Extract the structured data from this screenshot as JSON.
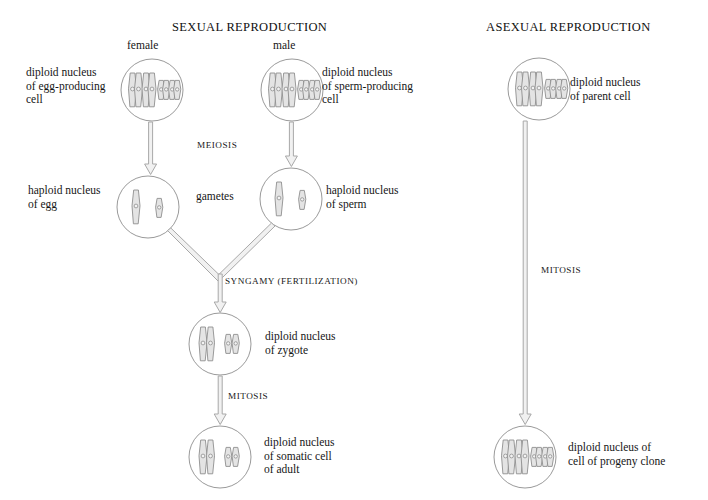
{
  "figure": {
    "columns": [
      {
        "id": "sexual",
        "title": "SEXUAL REPRODUCTION"
      },
      {
        "id": "asexual",
        "title": "ASEXUAL REPRODUCTION"
      }
    ]
  },
  "sexual": {
    "title": "SEXUAL REPRODUCTION",
    "female_label": "female",
    "male_label": "male",
    "egg_parent_label": "diploid nucleus\nof egg-producing\ncell",
    "sperm_parent_label": "diploid nucleus\nof sperm-producing\ncell",
    "meiosis_label": "MEIOSIS",
    "gametes_label": "gametes",
    "egg_label": "haploid nucleus\nof egg",
    "sperm_label": "haploid nucleus\nof sperm",
    "syngamy_label": "SYNGAMY (FERTILIZATION)",
    "zygote_label": "diploid nucleus\nof zygote",
    "mitosis_label": "MITOSIS",
    "somatic_label": "diploid nucleus\nof somatic cell\nof adult"
  },
  "asexual": {
    "title": "ASEXUAL REPRODUCTION",
    "parent_label": "diploid nucleus\nof parent cell",
    "mitosis_label": "MITOSIS",
    "progeny_label": "diploid nucleus of\ncell of progeny clone"
  },
  "cells": [
    {
      "id": "egg-parent-cell",
      "name": "diploid nucleus of egg-producing cell",
      "ploidy": "diploid",
      "cx": 152,
      "cy": 90,
      "r": 31,
      "chromosomes": "two-pairs-duplicated"
    },
    {
      "id": "sperm-parent-cell",
      "name": "diploid nucleus of sperm-producing cell",
      "ploidy": "diploid",
      "cx": 292,
      "cy": 90,
      "r": 31,
      "chromosomes": "two-pairs-duplicated"
    },
    {
      "id": "egg-cell",
      "name": "haploid nucleus of egg",
      "ploidy": "haploid",
      "cx": 148,
      "cy": 207,
      "r": 31,
      "chromosomes": "two-single"
    },
    {
      "id": "sperm-cell",
      "name": "haploid nucleus of sperm",
      "ploidy": "haploid",
      "cx": 291,
      "cy": 199,
      "r": 31,
      "chromosomes": "two-single"
    },
    {
      "id": "zygote-cell",
      "name": "diploid nucleus of zygote",
      "ploidy": "diploid",
      "cx": 220,
      "cy": 344,
      "r": 31,
      "chromosomes": "two-pairs-single"
    },
    {
      "id": "somatic-cell",
      "name": "diploid nucleus of somatic cell of adult",
      "ploidy": "diploid",
      "cx": 220,
      "cy": 457,
      "r": 31,
      "chromosomes": "two-pairs-single"
    },
    {
      "id": "asexual-parent-cell",
      "name": "diploid nucleus of parent cell",
      "ploidy": "diploid",
      "cx": 539,
      "cy": 89,
      "r": 31,
      "chromosomes": "two-pairs-duplicated"
    },
    {
      "id": "asexual-progeny-cell",
      "name": "diploid nucleus of cell of progeny clone",
      "ploidy": "diploid",
      "cx": 525,
      "cy": 457,
      "r": 31,
      "chromosomes": "two-pairs-duplicated"
    }
  ],
  "colors": {
    "outline": "#9a9a9a",
    "chromosome_fill": "#e4e4e4",
    "chromosome_stroke": "#8e8e8e",
    "arrow_stroke": "#a8a8a8",
    "arrow_fill": "#eeeeee",
    "text": "#161616",
    "background": "#ffffff"
  }
}
